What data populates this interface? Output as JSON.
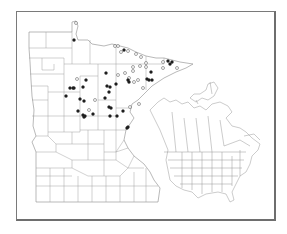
{
  "figure": {
    "type": "species-distribution-map",
    "main_map": "Minnesota (county outlines)",
    "inset_map": "North America (state/province outlines)"
  },
  "legend": {
    "filled_dot": "specimen record (filled)",
    "open_dot": "record (open)"
  },
  "colors": {
    "frame": "#7a7a7a",
    "outline": "#9a9a9a",
    "filled_dot": "#1e1e1e",
    "open_dot_stroke": "#4a4a4a",
    "background": "#ffffff"
  },
  "points": {
    "filled": [
      [
        74,
        40
      ],
      [
        124,
        50
      ],
      [
        168,
        61
      ],
      [
        172,
        62
      ],
      [
        170,
        64
      ],
      [
        151,
        72
      ],
      [
        147,
        79
      ],
      [
        149,
        80
      ],
      [
        152,
        80
      ],
      [
        106,
        73
      ],
      [
        116,
        84
      ],
      [
        107,
        86
      ],
      [
        110,
        87
      ],
      [
        109,
        92
      ],
      [
        86,
        80
      ],
      [
        70,
        88
      ],
      [
        73,
        88
      ],
      [
        74,
        88
      ],
      [
        83,
        87
      ],
      [
        66,
        96
      ],
      [
        80,
        99
      ],
      [
        84,
        101
      ],
      [
        105,
        98
      ],
      [
        109,
        107
      ],
      [
        111,
        108
      ],
      [
        123,
        111
      ],
      [
        78,
        111
      ],
      [
        93,
        114
      ],
      [
        83,
        115
      ],
      [
        85,
        116
      ],
      [
        84,
        117
      ],
      [
        110,
        116
      ],
      [
        117,
        116
      ],
      [
        127,
        128
      ],
      [
        128,
        127
      ],
      [
        128,
        80
      ],
      [
        129,
        82
      ]
    ],
    "open": [
      [
        76,
        23
      ],
      [
        115,
        46
      ],
      [
        118,
        46
      ],
      [
        121,
        52
      ],
      [
        128,
        51
      ],
      [
        136,
        54
      ],
      [
        141,
        57
      ],
      [
        146,
        63
      ],
      [
        146,
        67
      ],
      [
        163,
        62
      ],
      [
        163,
        68
      ],
      [
        177,
        68
      ],
      [
        125,
        73
      ],
      [
        133,
        67
      ],
      [
        133,
        71
      ],
      [
        140,
        66
      ],
      [
        118,
        75
      ],
      [
        129,
        78
      ],
      [
        134,
        82
      ],
      [
        138,
        80
      ],
      [
        143,
        88
      ],
      [
        77,
        79
      ],
      [
        95,
        100
      ],
      [
        89,
        110
      ],
      [
        130,
        107
      ],
      [
        139,
        104
      ]
    ]
  }
}
